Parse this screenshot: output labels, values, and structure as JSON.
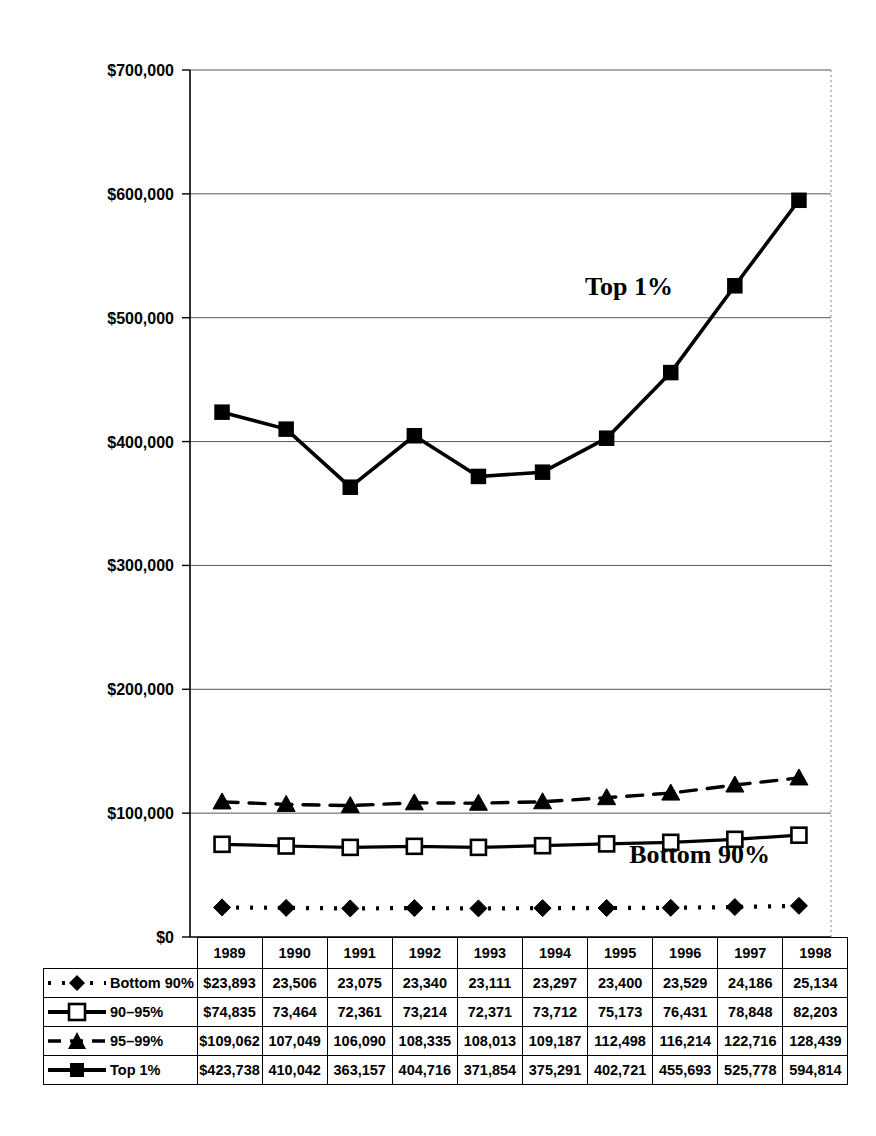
{
  "chart_data": {
    "type": "line",
    "title": "",
    "xlabel": "",
    "ylabel": "",
    "ylim": [
      0,
      700000
    ],
    "ytick_step": 100000,
    "grid": true,
    "legend_position": "table-below",
    "axis_labels": {
      "y_ticks": [
        "$0",
        "$100,000",
        "$200,000",
        "$300,000",
        "$400,000",
        "$500,000",
        "$600,000",
        "$700,000"
      ],
      "y_tick_values": [
        0,
        100000,
        200000,
        300000,
        400000,
        500000,
        600000,
        700000
      ]
    },
    "categories": [
      "1989",
      "1990",
      "1991",
      "1992",
      "1993",
      "1994",
      "1995",
      "1996",
      "1997",
      "1998"
    ],
    "series": [
      {
        "name": "Bottom 90%",
        "marker": "filled-diamond",
        "line_style": "dotted",
        "color": "#000000",
        "values": [
          23893,
          23506,
          23075,
          23340,
          23111,
          23297,
          23400,
          23529,
          24186,
          25134
        ],
        "display_values": [
          "$23,893",
          "23,506",
          "23,075",
          "23,340",
          "23,111",
          "23,297",
          "23,400",
          "23,529",
          "24,186",
          "25,134"
        ]
      },
      {
        "name": "90–95%",
        "marker": "open-square",
        "line_style": "solid",
        "color": "#000000",
        "values": [
          74835,
          73464,
          72361,
          73214,
          72371,
          73712,
          75173,
          76431,
          78848,
          82203
        ],
        "display_values": [
          "$74,835",
          "73,464",
          "72,361",
          "73,214",
          "72,371",
          "73,712",
          "75,173",
          "76,431",
          "78,848",
          "82,203"
        ]
      },
      {
        "name": "95–99%",
        "marker": "filled-triangle",
        "line_style": "dashed",
        "color": "#000000",
        "values": [
          109062,
          107049,
          106090,
          108335,
          108013,
          109187,
          112498,
          116214,
          122716,
          128439
        ],
        "display_values": [
          "$109,062",
          "107,049",
          "106,090",
          "108,335",
          "108,013",
          "109,187",
          "112,498",
          "116,214",
          "122,716",
          "128,439"
        ]
      },
      {
        "name": "Top 1%",
        "marker": "filled-square",
        "line_style": "solid",
        "color": "#000000",
        "values": [
          423738,
          410042,
          363157,
          404716,
          371854,
          375291,
          402721,
          455693,
          525778,
          594814
        ],
        "display_values": [
          "$423,738",
          "410,042",
          "363,157",
          "404,716",
          "371,854",
          "375,291",
          "402,721",
          "455,693",
          "525,778",
          "594,814"
        ]
      }
    ],
    "annotations": [
      {
        "text": "Top 1%",
        "x": 1995.35,
        "y": 518000
      },
      {
        "text": "Bottom 90%",
        "x": 1996.45,
        "y": 60000
      }
    ]
  },
  "table": {
    "header_row_label": "",
    "year_headers": [
      "1989",
      "1990",
      "1991",
      "1992",
      "1993",
      "1994",
      "1995",
      "1996",
      "1997",
      "1998"
    ],
    "rows": [
      {
        "label": "Bottom 90%",
        "marker": "filled-diamond",
        "line_style": "dotted",
        "cells": [
          "$23,893",
          "23,506",
          "23,075",
          "23,340",
          "23,111",
          "23,297",
          "23,400",
          "23,529",
          "24,186",
          "25,134"
        ]
      },
      {
        "label": "90–95%",
        "marker": "open-square",
        "line_style": "solid",
        "cells": [
          "$74,835",
          "73,464",
          "72,361",
          "73,214",
          "72,371",
          "73,712",
          "75,173",
          "76,431",
          "78,848",
          "82,203"
        ]
      },
      {
        "label": "95–99%",
        "marker": "filled-triangle",
        "line_style": "dashed",
        "cells": [
          "$109,062",
          "107,049",
          "106,090",
          "108,335",
          "108,013",
          "109,187",
          "112,498",
          "116,214",
          "122,716",
          "128,439"
        ]
      },
      {
        "label": "Top 1%",
        "marker": "filled-square",
        "line_style": "solid",
        "cells": [
          "$423,738",
          "410,042",
          "363,157",
          "404,716",
          "371,854",
          "375,291",
          "402,721",
          "455,693",
          "525,778",
          "594,814"
        ]
      }
    ]
  },
  "colors": {
    "ink": "#000000",
    "gridline": "#555555",
    "background": "#ffffff"
  }
}
